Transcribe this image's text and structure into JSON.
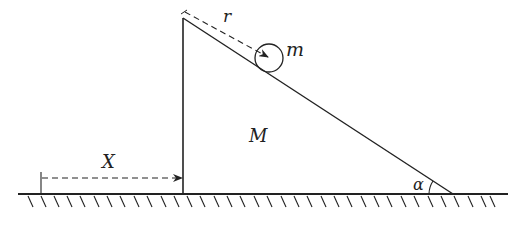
{
  "diagram": {
    "labels": {
      "mass_small": "m",
      "mass_wedge": "M",
      "distance_r": "r",
      "distance_X": "X",
      "angle": "α"
    },
    "colors": {
      "stroke": "#222222",
      "background": "#ffffff"
    },
    "geometry": {
      "wedge_top": [
        183,
        18
      ],
      "wedge_bottom_left": [
        183,
        194
      ],
      "wedge_bottom_right": [
        453,
        194
      ],
      "ground_y": 194,
      "ground_x_range": [
        18,
        508
      ],
      "ball_center": [
        269,
        58
      ],
      "ball_radius": 14
    }
  }
}
